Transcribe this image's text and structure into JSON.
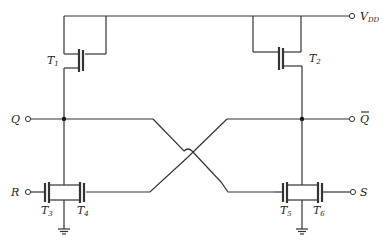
{
  "diagram": {
    "title": "",
    "type": "CMOS/NMOS SR latch circuit",
    "colors": {
      "wire": "#333333",
      "background": "#ffffff",
      "node": "#111111"
    },
    "supply": {
      "label": "V",
      "subscript": "DD"
    },
    "terminals": {
      "q": {
        "label": "Q"
      },
      "q_bar": {
        "label": "Q",
        "overbar": true
      },
      "r": {
        "label": "R"
      },
      "s": {
        "label": "S"
      }
    },
    "transistors": [
      {
        "id": "T1",
        "label": "T",
        "subscript": "1"
      },
      {
        "id": "T2",
        "label": "T",
        "subscript": "2"
      },
      {
        "id": "T3",
        "label": "T",
        "subscript": "3"
      },
      {
        "id": "T4",
        "label": "T",
        "subscript": "4"
      },
      {
        "id": "T5",
        "label": "T",
        "subscript": "5"
      },
      {
        "id": "T6",
        "label": "T",
        "subscript": "6"
      }
    ]
  }
}
